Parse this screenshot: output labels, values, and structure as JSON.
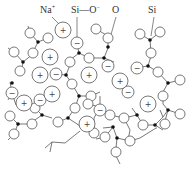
{
  "labels": {
    "na": "Na",
    "na_sup": "+",
    "si_o": "Si—O",
    "si_o_sup": "−",
    "o": "O",
    "si": "Si"
  },
  "legend_meaning": {
    "small_dot": "Si",
    "open_circle": "O (bridging oxygen)",
    "circle_minus": "Si—O− (non-bridging oxygen)",
    "circle_plus": "Na+ (sodium ion)"
  },
  "ions": {
    "plus_sign": "+",
    "minus_sign": "−"
  },
  "colors": {
    "stroke": "#555555",
    "background": "#ffffff",
    "silicon": "#111111"
  }
}
